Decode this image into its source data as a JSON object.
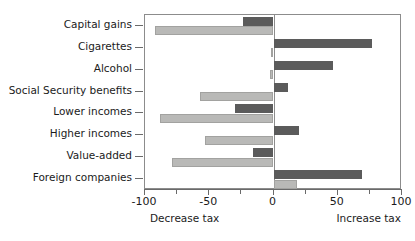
{
  "chart_data": {
    "type": "bar",
    "orientation": "horizontal",
    "title": "",
    "subtitle": "",
    "xlabel": "",
    "ylabel": "",
    "xlim": [
      -100,
      100
    ],
    "grid": false,
    "legend_position": "none",
    "categories": [
      "Capital gains",
      "Cigarettes",
      "Alcohol",
      "Social Security benefits",
      "Lower incomes",
      "Higher incomes",
      "Value-added",
      "Foreign companies"
    ],
    "series": [
      {
        "name": "dark",
        "color": "#5b5b5b",
        "values": [
          -24,
          77,
          46,
          11,
          -30,
          20,
          -16,
          69
        ]
      },
      {
        "name": "light",
        "color": "#b9b9b7",
        "values": [
          -92,
          -2,
          -3,
          -57,
          -88,
          -53,
          -79,
          18
        ]
      }
    ],
    "x_ticks": [
      -100,
      -50,
      0,
      50,
      100
    ],
    "x_tick_labels": [
      "-100",
      "-50",
      "0",
      "50",
      "100"
    ],
    "x_minor_ticks": [
      -75,
      -25,
      25,
      75
    ],
    "annotations": {
      "left_note": "Decrease tax",
      "right_note": "Increase tax"
    }
  }
}
